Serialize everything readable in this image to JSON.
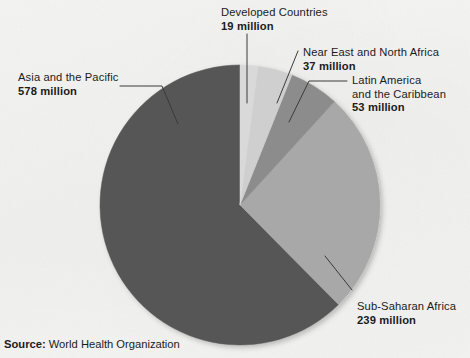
{
  "chart_data": {
    "type": "pie",
    "title": "",
    "unit": "million",
    "total": 926,
    "categories": [
      "Developed Countries",
      "Near East and North Africa",
      "Latin America and the Caribbean",
      "Sub-Saharan Africa",
      "Asia and the Pacific"
    ],
    "values": [
      19,
      37,
      53,
      239,
      578
    ],
    "legend_position": "callout-labels",
    "grid": false,
    "slices": [
      {
        "label": "Developed Countries",
        "value": 19,
        "value_text": "19 million",
        "color": "#d9d9d9",
        "start_angle": 0.0,
        "sweep_angle": 7.39,
        "label_lines": [
          "Developed Countries"
        ]
      },
      {
        "label": "Near East and North Africa",
        "value": 37,
        "value_text": "37 million",
        "color": "#cfcfcf",
        "start_angle": 7.39,
        "sweep_angle": 14.38,
        "label_lines": [
          "Near East and North Africa"
        ]
      },
      {
        "label": "Latin America and the Caribbean",
        "value": 53,
        "value_text": "53 million",
        "color": "#8c8c8c",
        "start_angle": 21.77,
        "sweep_angle": 20.61,
        "label_lines": [
          "Latin America",
          "and the Caribbean"
        ]
      },
      {
        "label": "Sub-Saharan Africa",
        "value": 239,
        "value_text": "239 million",
        "color": "#a8a8a8",
        "start_angle": 42.38,
        "sweep_angle": 92.92,
        "label_lines": [
          "Sub-Saharan Africa"
        ]
      },
      {
        "label": "Asia and the Pacific",
        "value": 578,
        "value_text": "578 million",
        "color": "#565656",
        "start_angle": 135.3,
        "sweep_angle": 224.7,
        "label_lines": [
          "Asia and the Pacific"
        ]
      }
    ]
  },
  "labels": {
    "developed": {
      "name": "Developed Countries",
      "value": "19 million"
    },
    "near_east": {
      "name": "Near East and North Africa",
      "value": "37 million"
    },
    "latin_america": {
      "name_line1": "Latin America",
      "name_line2": "and the Caribbean",
      "value": "53 million"
    },
    "asia_pacific": {
      "name": "Asia and the Pacific",
      "value": "578 million"
    },
    "sub_saharan": {
      "name": "Sub-Saharan Africa",
      "value": "239 million"
    }
  },
  "source": {
    "label": "Source:",
    "value": "World Health Organization"
  },
  "colors": {
    "background": "#f4f4f2",
    "text": "#1b1b1b",
    "leader_line": "#3a3a3a",
    "slice_developed": "#d9d9d9",
    "slice_near_east": "#cfcfcf",
    "slice_latin_america": "#8c8c8c",
    "slice_sub_saharan": "#a8a8a8",
    "slice_asia_pacific": "#565656"
  }
}
